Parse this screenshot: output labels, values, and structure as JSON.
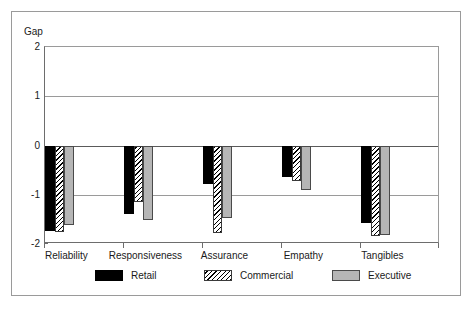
{
  "chart_data": {
    "type": "bar",
    "title": "",
    "xlabel": "",
    "ylabel": "Gap",
    "categories": [
      "Reliability",
      "Responsiveness",
      "Assurance",
      "Empathy",
      "Tangibles"
    ],
    "series": [
      {
        "name": "Retail",
        "values": [
          -1.73,
          -1.4,
          -0.79,
          -0.63,
          -1.57
        ]
      },
      {
        "name": "Commercial",
        "values": [
          -1.76,
          -1.15,
          -1.77,
          -0.73,
          -1.84
        ]
      },
      {
        "name": "Executive",
        "values": [
          -1.62,
          -1.52,
          -1.48,
          -0.9,
          -1.82
        ]
      }
    ],
    "ylim": [
      -2,
      2
    ],
    "yticks": [
      2,
      1,
      0,
      -1,
      -2
    ],
    "ytick_labels": [
      "2",
      "1",
      "0",
      "-1",
      "-2"
    ],
    "grid": true,
    "legend_position": "bottom",
    "colors": {
      "retail": "#000000",
      "commercial": "#ffffff",
      "executive": "#b6b6b6",
      "axis": "#6d6d6d",
      "grid": "#9a9a9a",
      "frame": "#9a9a9a",
      "text": "#1a1a1a",
      "background": "#ffffff"
    }
  },
  "legend": {
    "items": [
      {
        "label": "Retail"
      },
      {
        "label": "Commercial"
      },
      {
        "label": "Executive"
      }
    ]
  }
}
